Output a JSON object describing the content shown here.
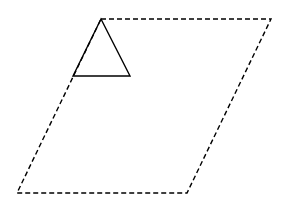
{
  "diagram": {
    "width": 282,
    "height": 203,
    "background": "#ffffff",
    "stroke_color": "#000000",
    "parallelogram": {
      "style": "dashed",
      "points": "101,19 271,19 187,193 17,193"
    },
    "triangle": {
      "style": "solid",
      "points": "101,19 130,76 73,76"
    }
  }
}
